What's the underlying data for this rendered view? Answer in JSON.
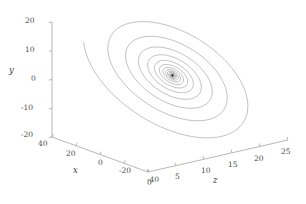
{
  "chart_data": {
    "type": "line",
    "title": "",
    "subtitle": "",
    "projection": "3d",
    "xlabel": "x",
    "ylabel": "y",
    "zlabel": "z",
    "xlim": [
      -40,
      40
    ],
    "ylim": [
      -20,
      20
    ],
    "zlim": [
      0,
      25
    ],
    "grid": false,
    "legend": null,
    "legend_position": "none",
    "line_color": "#1a1a1a",
    "background": "#ffffff",
    "axis_color": "#9a9a9a",
    "axes": {
      "y": {
        "label": "y",
        "ticks": [
          "20",
          "10",
          "0",
          "-10",
          "-20"
        ],
        "tick_values": [
          20,
          10,
          0,
          -10,
          -20
        ],
        "orientation": "vertical-left"
      },
      "x": {
        "label": "x",
        "ticks": [
          "40",
          "20",
          "0",
          "-20",
          "-40"
        ],
        "tick_values": [
          40,
          20,
          0,
          -20,
          -40
        ],
        "orientation": "depth-descending-right"
      },
      "z": {
        "label": "z",
        "ticks": [
          "0",
          "5",
          "10",
          "15",
          "20",
          "25"
        ],
        "tick_values": [
          0,
          5,
          10,
          15,
          20,
          25
        ],
        "orientation": "depth-ascending-right"
      }
    },
    "series": [
      {
        "name": "trajectory",
        "color": "#1a1a1a",
        "style": "solid",
        "width": 0.35,
        "system": "chaotic-attractor",
        "params": {
          "a": 36.0,
          "b": 3.0,
          "c": 20.0,
          "d": 0.0
        },
        "initial_state": [
          0.8,
          0.4,
          9.0
        ],
        "dt": 0.0025,
        "steps": 52000
      }
    ]
  },
  "geometry": {
    "origin": {
      "x": 52,
      "y": 137
    },
    "y_axis_top": {
      "x": 52,
      "y": 22
    },
    "x_axis_end": {
      "x": 148,
      "y": 172
    },
    "z_axis_end": {
      "x": 288,
      "y": 140
    }
  },
  "tick_labels": {
    "y": [
      {
        "text": "20",
        "left": 25,
        "top": 17
      },
      {
        "text": "10",
        "left": 25,
        "top": 46
      },
      {
        "text": "0",
        "left": 31,
        "top": 75
      },
      {
        "text": "-10",
        "left": 21,
        "top": 104
      },
      {
        "text": "-20",
        "left": 21,
        "top": 131
      }
    ],
    "x": [
      {
        "text": "40",
        "left": 38,
        "top": 140
      },
      {
        "text": "20",
        "left": 66,
        "top": 150
      },
      {
        "text": "0",
        "left": 98,
        "top": 159
      },
      {
        "text": "-20",
        "left": 119,
        "top": 167
      },
      {
        "text": "-40",
        "left": 147,
        "top": 176
      }
    ],
    "z": [
      {
        "text": "0",
        "left": 147,
        "top": 179
      },
      {
        "text": "5",
        "left": 175,
        "top": 173
      },
      {
        "text": "10",
        "left": 201,
        "top": 167
      },
      {
        "text": "15",
        "left": 228,
        "top": 161
      },
      {
        "text": "20",
        "left": 254,
        "top": 155
      },
      {
        "text": "25",
        "left": 281,
        "top": 148
      }
    ]
  },
  "axis_labels": {
    "y": {
      "text": "y",
      "left": 9,
      "top": 66
    },
    "x": {
      "text": "x",
      "left": 73,
      "top": 166
    },
    "z": {
      "text": "z",
      "left": 213,
      "top": 176
    }
  }
}
